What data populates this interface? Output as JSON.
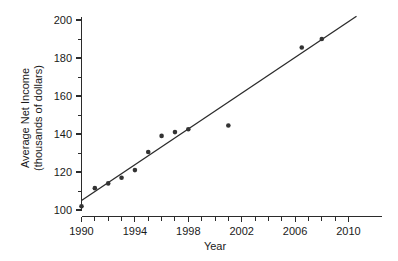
{
  "chart_data": {
    "type": "scatter",
    "title": "",
    "subtitle": "",
    "xlabel": "Year",
    "ylabel": "Average Net Income (thousands of dollars)",
    "ylabel_line1": "Average Net Income",
    "ylabel_line2": "(thousands of dollars)",
    "xlim": [
      1989,
      2011
    ],
    "ylim": [
      96,
      204
    ],
    "grid": false,
    "legend": null,
    "legend_position": "none",
    "x_tick_labels": [
      "1990",
      "1994",
      "1998",
      "2002",
      "2006",
      "2010"
    ],
    "x_tick_values": [
      1990,
      1994,
      1998,
      2002,
      2006,
      2010
    ],
    "x_minor_tick_values": [
      1991,
      1992,
      1993,
      1995,
      1996,
      1997,
      1999,
      2000,
      2001,
      2003,
      2004,
      2005,
      2007,
      2008,
      2009
    ],
    "y_tick_labels": [
      "100",
      "120",
      "140",
      "160",
      "180",
      "200"
    ],
    "y_tick_values": [
      100,
      120,
      140,
      160,
      180,
      200
    ],
    "y_minor_tick_values": [
      110,
      130,
      150,
      170,
      190
    ],
    "series": [
      {
        "name": "Average Net Income",
        "marker": "circle",
        "color": "#333333",
        "points": [
          {
            "x": 1990.0,
            "y": 102.0
          },
          {
            "x": 1991.0,
            "y": 111.5
          },
          {
            "x": 1992.0,
            "y": 114.0
          },
          {
            "x": 1993.0,
            "y": 117.0
          },
          {
            "x": 1994.0,
            "y": 121.0
          },
          {
            "x": 1995.0,
            "y": 130.5
          },
          {
            "x": 1996.0,
            "y": 139.0
          },
          {
            "x": 1997.0,
            "y": 141.0
          },
          {
            "x": 1998.0,
            "y": 142.5
          },
          {
            "x": 2001.0,
            "y": 144.5
          },
          {
            "x": 2006.5,
            "y": 185.5
          },
          {
            "x": 2008.0,
            "y": 190.0
          }
        ]
      }
    ],
    "trend_line": {
      "name": "least-squares regression line",
      "color": "#2b2b2b",
      "x_start": 1990.0,
      "y_start": 105.0,
      "x_end": 2010.6,
      "y_end": 202.0
    },
    "colors": {
      "axis": "#2b2b2b",
      "marker": "#333333",
      "trend": "#2b2b2b",
      "background": "#ffffff",
      "text": "#1a1a1a"
    }
  }
}
